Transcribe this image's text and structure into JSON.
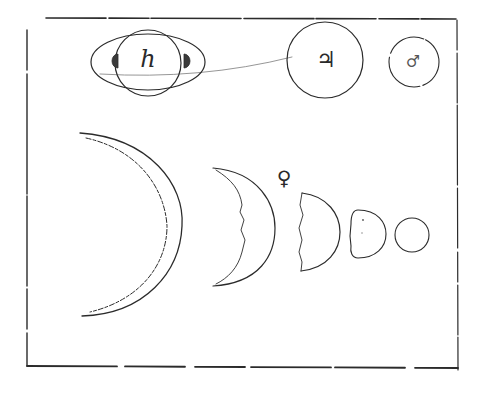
{
  "drawing": {
    "colors": {
      "paper": "#ffffff",
      "ink": "#2b2b2b",
      "faint_ink": "#8a8a8a"
    },
    "frame": {
      "x": 27,
      "y": 18,
      "width": 430,
      "height": 348
    },
    "top_row": {
      "saturn": {
        "symbol": "h",
        "label_name": "Saturn"
      },
      "jupiter": {
        "symbol": "♃",
        "label_name": "Jupiter"
      },
      "mars": {
        "symbol": "♂",
        "label_name": "Mars"
      }
    },
    "venus_phases": {
      "symbol": "♀",
      "label_name": "Venus",
      "phases": [
        "large crescent",
        "crescent",
        "half",
        "gibbous",
        "full"
      ]
    }
  }
}
